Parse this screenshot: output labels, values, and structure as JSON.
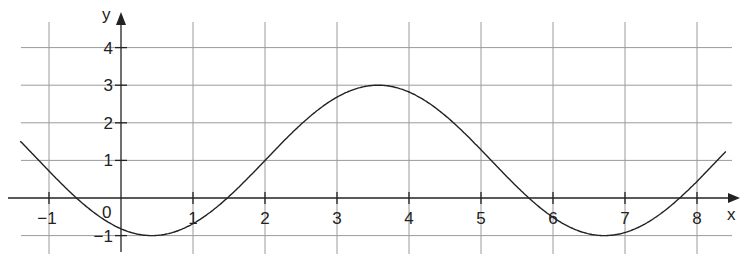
{
  "chart_data": {
    "type": "line",
    "title": "",
    "xlabel": "x",
    "ylabel": "y",
    "xlim": [
      -1.4,
      8.4
    ],
    "ylim": [
      -1.4,
      4.5
    ],
    "grid": true,
    "x_ticks": [
      -1,
      1,
      2,
      3,
      4,
      5,
      6,
      7,
      8
    ],
    "x_tick_labels": [
      "−1",
      "1",
      "2",
      "3",
      "4",
      "5",
      "6",
      "7",
      "8"
    ],
    "y_ticks": [
      -1,
      1,
      2,
      3,
      4
    ],
    "y_tick_labels": [
      "−1",
      "1",
      "2",
      "3",
      "4"
    ],
    "origin_label": "0",
    "series": [
      {
        "name": "f(x)",
        "description": "sinusoidal curve, amplitude 2, midline y=1, period ≈ 2π, minima ≈ (0.43, −1) and (6.71, −1), maximum ≈ (3.57, 3)",
        "x": [
          -1.4,
          -1,
          -0.5,
          0,
          0.43,
          1,
          1.5,
          2,
          2.5,
          3,
          3.57,
          4,
          4.5,
          5,
          5.5,
          6,
          6.5,
          6.71,
          7,
          7.5,
          8,
          8.4
        ],
        "y": [
          1.51,
          0.72,
          0.0,
          -0.82,
          -1.0,
          -0.68,
          0.04,
          1.0,
          1.96,
          2.68,
          3.0,
          2.82,
          2.2,
          1.28,
          0.3,
          -0.51,
          -0.96,
          -1.0,
          -0.92,
          -0.42,
          0.44,
          1.19
        ]
      }
    ],
    "notable_points": {
      "minimum_1": [
        0.43,
        -1
      ],
      "maximum": [
        3.57,
        3
      ],
      "minimum_2": [
        6.71,
        -1
      ],
      "y_intercept": [
        0,
        -0.82
      ],
      "x_intercepts": [
        -0.52,
        1.48,
        5.66,
        7.76
      ]
    }
  },
  "axes": {
    "x_label": "x",
    "y_label": "y"
  }
}
